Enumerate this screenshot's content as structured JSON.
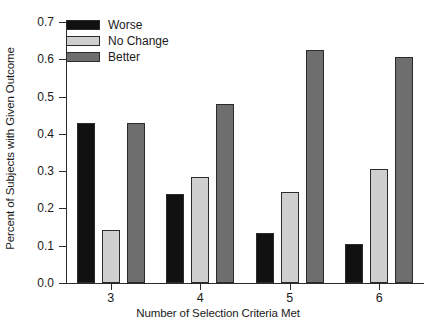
{
  "chart_data": {
    "type": "bar",
    "title": "",
    "xlabel": "Number of Selection Criteria Met",
    "ylabel": "Percent of Subjects with Given Outcome",
    "categories": [
      "3",
      "4",
      "5",
      "6"
    ],
    "series": [
      {
        "name": "Worse",
        "color": "#111111",
        "values": [
          0.43,
          0.24,
          0.135,
          0.105
        ]
      },
      {
        "name": "No Change",
        "color": "#cfcfcf",
        "values": [
          0.142,
          0.285,
          0.245,
          0.305
        ]
      },
      {
        "name": "Better",
        "color": "#6e6e6e",
        "values": [
          0.43,
          0.48,
          0.625,
          0.605
        ]
      }
    ],
    "ylim": [
      0.0,
      0.7
    ],
    "ytick_labels": [
      "0.0",
      "0.1",
      "0.2",
      "0.3",
      "0.4",
      "0.5",
      "0.6",
      "0.7"
    ],
    "ytick_values": [
      0.0,
      0.1,
      0.2,
      0.3,
      0.4,
      0.5,
      0.6,
      0.7
    ],
    "xtick_labels": [
      "3",
      "4",
      "5",
      "6"
    ],
    "grid": false,
    "legend_position": "top-left",
    "legend_entries": [
      "Worse",
      "No Change",
      "Better"
    ]
  }
}
